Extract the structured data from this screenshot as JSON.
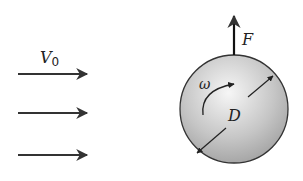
{
  "diagram": {
    "type": "physics-free-body",
    "flow": {
      "label": "V",
      "subscript": "0",
      "arrows": [
        {
          "y": 74
        },
        {
          "y": 113
        },
        {
          "y": 155
        }
      ],
      "arrow_x_start": 18,
      "arrow_x_end": 88
    },
    "sphere": {
      "cx": 234,
      "cy": 109,
      "r": 54,
      "fill_light": "#f4f4f4",
      "fill_dark": "#a8a8a8",
      "stroke": "#333333"
    },
    "force": {
      "label": "F",
      "x": 234,
      "y_start": 55,
      "y_end": 14
    },
    "rotation": {
      "label": "ω"
    },
    "diameter": {
      "label": "D"
    },
    "colors": {
      "ink": "#333333"
    }
  }
}
